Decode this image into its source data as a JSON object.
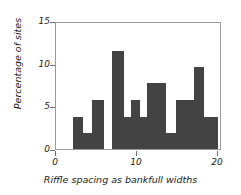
{
  "chart_data": {
    "type": "bar",
    "title": "",
    "subtitle": "",
    "xlabel": "Riffle spacing as bankfull widths",
    "ylabel": "Percentage of sites",
    "xlim": [
      0,
      20.5
    ],
    "ylim": [
      0,
      15
    ],
    "xticks": [
      0,
      10,
      20
    ],
    "xtick_labels": [
      "0",
      "10",
      "20"
    ],
    "yticks": [
      0,
      5,
      10,
      15
    ],
    "ytick_labels": [
      "0",
      "5",
      "10",
      "15"
    ],
    "grid": false,
    "legend": "none",
    "bar_color": "#434343",
    "frame_color": "#9a9a9a",
    "histogram_note": "Histogram of riffle spacing measured in bankfull widths; bin width approximately 1.35 units.",
    "bins": [
      {
        "x0": 2.05,
        "x1": 3.35,
        "value": 3.8
      },
      {
        "x0": 3.35,
        "x1": 4.45,
        "value": 1.9
      },
      {
        "x0": 4.45,
        "x1": 5.95,
        "value": 5.7
      },
      {
        "x0": 5.95,
        "x1": 6.95,
        "value": 0.0
      },
      {
        "x0": 6.95,
        "x1": 8.35,
        "value": 11.5
      },
      {
        "x0": 8.35,
        "x1": 9.25,
        "value": 3.8
      },
      {
        "x0": 9.25,
        "x1": 10.35,
        "value": 5.7
      },
      {
        "x0": 10.35,
        "x1": 11.2,
        "value": 3.8
      },
      {
        "x0": 11.2,
        "x1": 12.5,
        "value": 7.7
      },
      {
        "x0": 12.5,
        "x1": 13.6,
        "value": 7.7
      },
      {
        "x0": 13.6,
        "x1": 14.8,
        "value": 1.9
      },
      {
        "x0": 14.8,
        "x1": 16.0,
        "value": 5.7
      },
      {
        "x0": 16.0,
        "x1": 17.1,
        "value": 5.7
      },
      {
        "x0": 17.1,
        "x1": 18.3,
        "value": 9.6
      },
      {
        "x0": 18.3,
        "x1": 20.0,
        "value": 3.8
      }
    ],
    "categories": [
      "2.05-3.35",
      "3.35-4.45",
      "4.45-5.95",
      "5.95-6.95",
      "6.95-8.35",
      "8.35-9.25",
      "9.25-10.35",
      "10.35-11.2",
      "11.2-12.5",
      "12.5-13.6",
      "13.6-14.8",
      "14.8-16.0",
      "16.0-17.1",
      "17.1-18.3",
      "18.3-20.0"
    ],
    "values": [
      3.8,
      1.9,
      5.7,
      0.0,
      11.5,
      3.8,
      5.7,
      3.8,
      7.7,
      7.7,
      1.9,
      5.7,
      5.7,
      9.6,
      3.8
    ]
  }
}
